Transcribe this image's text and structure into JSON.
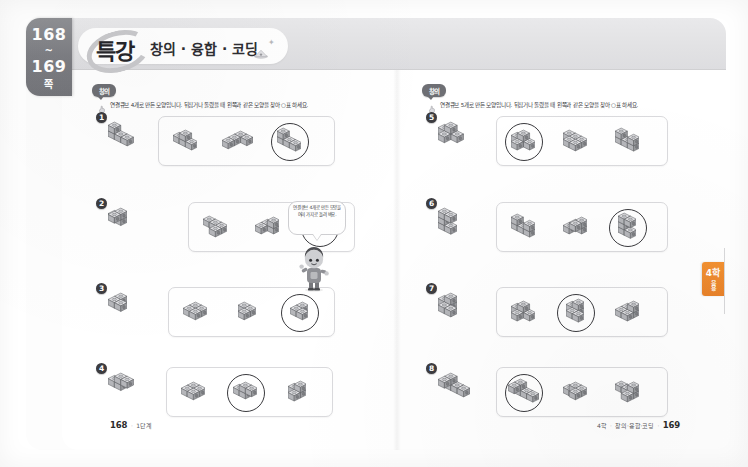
{
  "book": {
    "spine": {
      "page_start": "168",
      "tilde": "~",
      "page_end": "169",
      "unit_label": "쪽"
    },
    "side_tab": {
      "grade": "4학",
      "sub": "응용"
    }
  },
  "header": {
    "title_main": "특강",
    "title_sub": "창의 · 융합 · 코딩",
    "deco_icon": "cloud-sparkle-icon"
  },
  "left_page": {
    "badge": "창의",
    "instruction": "연결큐브 4개로 만든 모양입니다. 뒤집거나 돌렸을 때 왼쪽과 같은 모양을 찾아 ○표 하세요.",
    "instruction_icon": "pointer-hand-icon",
    "problems": [
      {
        "number": "❶",
        "number_text": "1",
        "ref_shape": "cube-shape-1-ref",
        "answer_index": 2,
        "options": [
          {
            "shape": "cube-shape-1-opt-a",
            "circled": false
          },
          {
            "shape": "cube-shape-1-opt-b",
            "circled": false
          },
          {
            "shape": "cube-shape-1-opt-c",
            "circled": true
          }
        ]
      },
      {
        "number": "❷",
        "number_text": "2",
        "ref_shape": "cube-shape-2-ref",
        "answer_index": 2,
        "options": [
          {
            "shape": "cube-shape-2-opt-a",
            "circled": false
          },
          {
            "shape": "cube-shape-2-opt-b",
            "circled": false
          },
          {
            "shape": "cube-shape-2-opt-c",
            "circled": true
          }
        ]
      },
      {
        "number": "❸",
        "number_text": "3",
        "ref_shape": "cube-shape-3-ref",
        "answer_index": 2,
        "options": [
          {
            "shape": "cube-shape-3-opt-a",
            "circled": false
          },
          {
            "shape": "cube-shape-3-opt-b",
            "circled": false
          },
          {
            "shape": "cube-shape-3-opt-c",
            "circled": true
          }
        ]
      },
      {
        "number": "❹",
        "number_text": "4",
        "ref_shape": "cube-shape-4-ref",
        "answer_index": 1,
        "options": [
          {
            "shape": "cube-shape-4-opt-a",
            "circled": false
          },
          {
            "shape": "cube-shape-4-opt-b",
            "circled": true
          },
          {
            "shape": "cube-shape-4-opt-c",
            "circled": false
          }
        ]
      }
    ],
    "hint_bubble": {
      "text": "연결큐브 4개로 만든 모양을 여러 가지로 돌려 봐요.",
      "character": "student-character-icon"
    },
    "footer": {
      "page": "168",
      "dot": "·",
      "label": "1단계"
    }
  },
  "right_page": {
    "badge": "창의",
    "instruction": "연결큐브 5개로 만든 모양입니다. 뒤집거나 돌렸을 때 왼쪽과 같은 모양을 찾아 ○표 하세요.",
    "instruction_icon": "pointer-hand-icon",
    "problems": [
      {
        "number": "❺",
        "number_text": "5",
        "ref_shape": "cube-shape-5-ref",
        "answer_index": 0,
        "options": [
          {
            "shape": "cube-shape-5-opt-a",
            "circled": true
          },
          {
            "shape": "cube-shape-5-opt-b",
            "circled": false
          },
          {
            "shape": "cube-shape-5-opt-c",
            "circled": false
          }
        ]
      },
      {
        "number": "❻",
        "number_text": "6",
        "ref_shape": "cube-shape-6-ref",
        "answer_index": 2,
        "options": [
          {
            "shape": "cube-shape-6-opt-a",
            "circled": false
          },
          {
            "shape": "cube-shape-6-opt-b",
            "circled": false
          },
          {
            "shape": "cube-shape-6-opt-c",
            "circled": true
          }
        ]
      },
      {
        "number": "❼",
        "number_text": "7",
        "ref_shape": "cube-shape-7-ref",
        "answer_index": 1,
        "options": [
          {
            "shape": "cube-shape-7-opt-a",
            "circled": false
          },
          {
            "shape": "cube-shape-7-opt-b",
            "circled": true
          },
          {
            "shape": "cube-shape-7-opt-c",
            "circled": false
          }
        ]
      },
      {
        "number": "❽",
        "number_text": "8",
        "ref_shape": "cube-shape-8-ref",
        "answer_index": 0,
        "options": [
          {
            "shape": "cube-shape-8-opt-a",
            "circled": true
          },
          {
            "shape": "cube-shape-8-opt-b",
            "circled": false
          },
          {
            "shape": "cube-shape-8-opt-c",
            "circled": false
          }
        ]
      }
    ],
    "footer": {
      "grade": "4학",
      "dot1": "·",
      "label": "창의·융합·코딩",
      "dot2": "·",
      "page": "169"
    }
  },
  "colors": {
    "tab_orange": "#f29132",
    "spine_grey": "#7d7e83",
    "header_grey": "#e4e4e6",
    "ink": "#2b2b2b"
  }
}
